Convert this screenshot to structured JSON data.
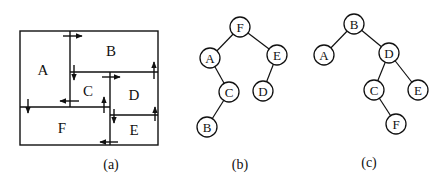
{
  "figure": {
    "panels": [
      {
        "id": "a",
        "caption": "(a)",
        "type": "floorplan",
        "regions": [
          {
            "label": "A",
            "x": 20,
            "y": 31,
            "w": 50,
            "h": 76
          },
          {
            "label": "B",
            "x": 70,
            "y": 31,
            "w": 88,
            "h": 41
          },
          {
            "label": "C",
            "x": 70,
            "y": 72,
            "w": 40,
            "h": 35
          },
          {
            "label": "D",
            "x": 110,
            "y": 72,
            "w": 48,
            "h": 43
          },
          {
            "label": "E",
            "x": 110,
            "y": 115,
            "w": 48,
            "h": 30
          },
          {
            "label": "F",
            "x": 20,
            "y": 107,
            "w": 90,
            "h": 38
          }
        ]
      },
      {
        "id": "b",
        "caption": "(b)",
        "type": "binary-tree",
        "nodes": [
          {
            "label": "F",
            "cx": 240,
            "cy": 27
          },
          {
            "label": "A",
            "cx": 210,
            "cy": 58
          },
          {
            "label": "E",
            "cx": 277,
            "cy": 55
          },
          {
            "label": "C",
            "cx": 229,
            "cy": 92
          },
          {
            "label": "D",
            "cx": 263,
            "cy": 91
          },
          {
            "label": "B",
            "cx": 207,
            "cy": 127
          }
        ],
        "edges": [
          [
            "F",
            "A"
          ],
          [
            "F",
            "E"
          ],
          [
            "A",
            "C"
          ],
          [
            "C",
            "B"
          ],
          [
            "E",
            "D"
          ]
        ]
      },
      {
        "id": "c",
        "caption": "(c)",
        "type": "binary-tree",
        "nodes": [
          {
            "label": "B",
            "cx": 354,
            "cy": 24
          },
          {
            "label": "A",
            "cx": 324,
            "cy": 55
          },
          {
            "label": "D",
            "cx": 389,
            "cy": 53
          },
          {
            "label": "C",
            "cx": 374,
            "cy": 90
          },
          {
            "label": "E",
            "cx": 418,
            "cy": 90
          },
          {
            "label": "F",
            "cx": 396,
            "cy": 124
          }
        ],
        "edges": [
          [
            "B",
            "A"
          ],
          [
            "B",
            "D"
          ],
          [
            "D",
            "C"
          ],
          [
            "D",
            "E"
          ],
          [
            "C",
            "F"
          ]
        ]
      }
    ]
  }
}
